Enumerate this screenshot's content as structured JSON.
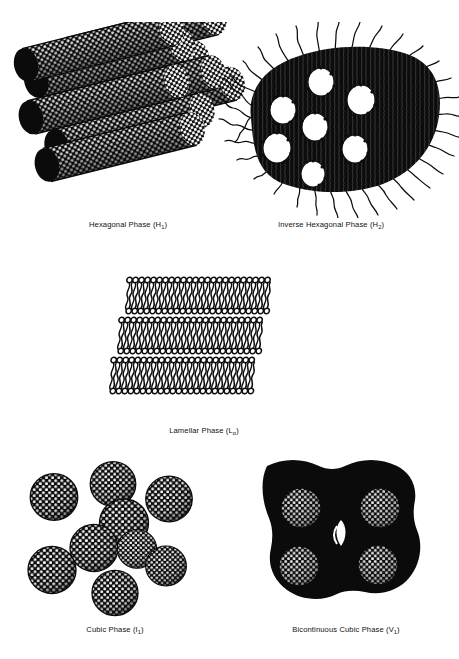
{
  "figure": {
    "background_color": "#ffffff",
    "ink_color": "#111111",
    "caption_font_size_px": 7.6
  },
  "panels": [
    {
      "id": "hexagonal",
      "label_prefix": "Hexagonal Phase (H",
      "label_subscript": "1",
      "label_suffix": ")",
      "label_full": "Hexagonal Phase (H1)",
      "structure_type": "packed-cylinders",
      "description": "Bundle of stippled normal micellar cylinders packed in hexagonal array",
      "cylinder_count": 9,
      "texture": "stipple-dots",
      "fill": "solid-black",
      "water_channels": 0
    },
    {
      "id": "inverse-hexagonal",
      "label_prefix": "Inverse Hexagonal Phase (H",
      "label_subscript": "2",
      "label_suffix": ")",
      "label_full": "Inverse Hexagonal Phase (H2)",
      "structure_type": "inverse-cylinders",
      "description": "Dark continuous oil matrix enclosing white water cores with outward wavy tail fringe",
      "water_channels": 7,
      "texture": "wavy-tail-fringe",
      "fill": "solid-black",
      "core_color": "#ffffff"
    },
    {
      "id": "lamellar",
      "label_prefix": "Lamellar Phase (L",
      "label_subscript": "α",
      "label_suffix": ")",
      "label_full": "Lamellar Phase (Lα)",
      "structure_type": "stacked-bilayers",
      "description": "Stack of surfactant bilayers, circular head groups facing the aqueous layers with interdigitated wavy tails",
      "bilayer_count": 3,
      "heads_per_row": 24,
      "texture": "head-and-tail-rows",
      "fill": "line-art"
    },
    {
      "id": "cubic",
      "label_prefix": "Cubic Phase (I",
      "label_subscript": "1",
      "label_suffix": ")",
      "label_full": "Cubic Phase (I1)",
      "structure_type": "discrete-spherical-micelles",
      "description": "Nine discrete stippled spherical micelles in a loose cubic arrangement",
      "micelle_count": 9,
      "texture": "honeycomb-stipple",
      "fill": "solid-black"
    },
    {
      "id": "bicontinuous-cubic",
      "label_prefix": "Bicontinuous Cubic Phase (V",
      "label_subscript": "1",
      "label_suffix": ")",
      "label_full": "Bicontinuous Cubic Phase (V1)",
      "structure_type": "bicontinuous-block",
      "description": "Solid dark block with four stippled circular channel openings in a two-by-two grid and concave notches at the edges",
      "channel_count": 4,
      "channel_grid": "2x2",
      "texture": "mesh-stipple",
      "fill": "solid-black"
    }
  ]
}
